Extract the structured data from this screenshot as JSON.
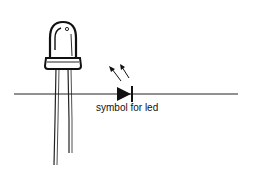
{
  "diagram": {
    "caption": "symbol for led",
    "colors": {
      "ink": "#111111",
      "background": "#ffffff"
    },
    "elements": [
      {
        "name": "led-illustration",
        "description": "LED component drawing with dome and two leads"
      },
      {
        "name": "wire-line",
        "description": "horizontal conductor line"
      },
      {
        "name": "led-schematic-symbol",
        "description": "diode triangle with cathode bar and two emission arrows"
      }
    ]
  }
}
